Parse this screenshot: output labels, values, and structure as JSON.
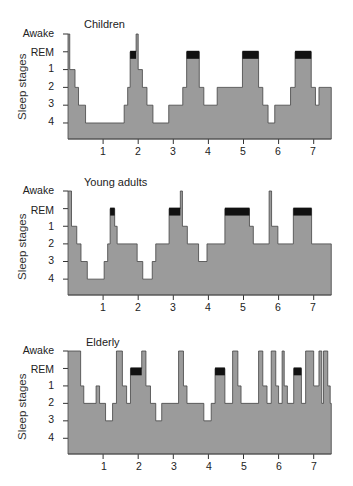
{
  "chart_data": [
    {
      "type": "area",
      "title": "Children",
      "xlabel": "",
      "ylabel": "Sleep stages",
      "x_ticks": [
        "1",
        "2",
        "3",
        "4",
        "5",
        "6",
        "7"
      ],
      "xlim": [
        0,
        7.5
      ],
      "y_ticks": [
        "Awake",
        "REM",
        "1",
        "2",
        "3",
        "4"
      ],
      "grid": false,
      "legend": "none",
      "fill_color": "#9b9b9b",
      "rem_color": "#111111",
      "series": [
        {
          "name": "hypnogram",
          "steps": [
            [
              0.0,
              "Awake"
            ],
            [
              0.05,
              "1"
            ],
            [
              0.2,
              "2"
            ],
            [
              0.3,
              "3"
            ],
            [
              0.5,
              "4"
            ],
            [
              1.6,
              "3"
            ],
            [
              1.7,
              "2"
            ],
            [
              1.77,
              "REM"
            ],
            [
              1.94,
              "Awake"
            ],
            [
              2.0,
              "1"
            ],
            [
              2.12,
              "2"
            ],
            [
              2.25,
              "3"
            ],
            [
              2.42,
              "4"
            ],
            [
              2.87,
              "3"
            ],
            [
              3.27,
              "2"
            ],
            [
              3.38,
              "REM"
            ],
            [
              3.74,
              "2"
            ],
            [
              3.87,
              "3"
            ],
            [
              4.25,
              "2"
            ],
            [
              4.97,
              "REM"
            ],
            [
              5.43,
              "2"
            ],
            [
              5.55,
              "3"
            ],
            [
              5.7,
              "4"
            ],
            [
              5.89,
              "3"
            ],
            [
              6.34,
              "2"
            ],
            [
              6.47,
              "REM"
            ],
            [
              6.93,
              "2"
            ],
            [
              7.05,
              "3"
            ],
            [
              7.15,
              "2"
            ],
            [
              7.5,
              "end"
            ]
          ]
        }
      ],
      "rem_periods": [
        [
          1.77,
          1.94
        ],
        [
          3.38,
          3.74
        ],
        [
          4.97,
          5.43
        ],
        [
          6.47,
          6.93
        ]
      ]
    },
    {
      "type": "area",
      "title": "Young adults",
      "xlabel": "",
      "ylabel": "Sleep stages",
      "x_ticks": [
        "1",
        "2",
        "3",
        "4",
        "5",
        "6",
        "7"
      ],
      "xlim": [
        0,
        7.5
      ],
      "y_ticks": [
        "Awake",
        "REM",
        "1",
        "2",
        "3",
        "4"
      ],
      "grid": false,
      "legend": "none",
      "fill_color": "#9b9b9b",
      "rem_color": "#111111",
      "series": [
        {
          "name": "hypnogram",
          "steps": [
            [
              0.0,
              "Awake"
            ],
            [
              0.1,
              "1"
            ],
            [
              0.25,
              "2"
            ],
            [
              0.37,
              "3"
            ],
            [
              0.55,
              "4"
            ],
            [
              1.03,
              "3"
            ],
            [
              1.13,
              "2"
            ],
            [
              1.2,
              "REM"
            ],
            [
              1.33,
              "1"
            ],
            [
              1.4,
              "2"
            ],
            [
              1.97,
              "3"
            ],
            [
              2.13,
              "4"
            ],
            [
              2.4,
              "3"
            ],
            [
              2.5,
              "2"
            ],
            [
              2.88,
              "REM"
            ],
            [
              3.2,
              "Awake"
            ],
            [
              3.26,
              "1"
            ],
            [
              3.4,
              "2"
            ],
            [
              3.72,
              "3"
            ],
            [
              3.96,
              "2"
            ],
            [
              4.47,
              "REM"
            ],
            [
              5.17,
              "1"
            ],
            [
              5.28,
              "2"
            ],
            [
              5.73,
              "Awake"
            ],
            [
              5.8,
              "1"
            ],
            [
              5.98,
              "2"
            ],
            [
              6.42,
              "REM"
            ],
            [
              6.94,
              "2"
            ],
            [
              7.5,
              "end"
            ]
          ]
        }
      ],
      "rem_periods": [
        [
          1.2,
          1.33
        ],
        [
          2.88,
          3.2
        ],
        [
          4.47,
          5.17
        ],
        [
          6.42,
          6.94
        ]
      ]
    },
    {
      "type": "area",
      "title": "Elderly",
      "xlabel": "",
      "ylabel": "Sleep stages",
      "x_ticks": [
        "1",
        "2",
        "3",
        "4",
        "5",
        "6",
        "7"
      ],
      "xlim": [
        0,
        7.5
      ],
      "y_ticks": [
        "Awake",
        "REM",
        "1",
        "2",
        "3",
        "4"
      ],
      "grid": false,
      "legend": "none",
      "fill_color": "#9b9b9b",
      "rem_color": "#111111",
      "series": [
        {
          "name": "hypnogram",
          "steps": [
            [
              0.0,
              "Awake"
            ],
            [
              0.36,
              "1"
            ],
            [
              0.45,
              "2"
            ],
            [
              0.8,
              "1"
            ],
            [
              0.9,
              "2"
            ],
            [
              1.07,
              "3"
            ],
            [
              1.27,
              "2"
            ],
            [
              1.38,
              "Awake"
            ],
            [
              1.55,
              "1"
            ],
            [
              1.67,
              "2"
            ],
            [
              1.78,
              "REM"
            ],
            [
              2.1,
              "Awake"
            ],
            [
              2.22,
              "1"
            ],
            [
              2.35,
              "2"
            ],
            [
              2.5,
              "3"
            ],
            [
              2.67,
              "2"
            ],
            [
              3.15,
              "Awake"
            ],
            [
              3.29,
              "1"
            ],
            [
              3.39,
              "2"
            ],
            [
              3.87,
              "3"
            ],
            [
              4.08,
              "2"
            ],
            [
              4.19,
              "REM"
            ],
            [
              4.47,
              "2"
            ],
            [
              4.69,
              "Awake"
            ],
            [
              4.84,
              "1"
            ],
            [
              4.93,
              "2"
            ],
            [
              5.43,
              "Awake"
            ],
            [
              5.55,
              "1"
            ],
            [
              5.67,
              "2"
            ],
            [
              5.79,
              "Awake"
            ],
            [
              5.92,
              "1"
            ],
            [
              6.0,
              "2"
            ],
            [
              6.1,
              "Awake"
            ],
            [
              6.16,
              "1"
            ],
            [
              6.25,
              "2"
            ],
            [
              6.43,
              "REM"
            ],
            [
              6.65,
              "2"
            ],
            [
              6.77,
              "Awake"
            ],
            [
              7.0,
              "1"
            ],
            [
              7.15,
              "Awake"
            ],
            [
              7.23,
              "2"
            ],
            [
              7.28,
              "Awake"
            ],
            [
              7.4,
              "1"
            ],
            [
              7.47,
              "2"
            ],
            [
              7.5,
              "end"
            ]
          ]
        }
      ],
      "rem_periods": [
        [
          1.78,
          2.1
        ],
        [
          4.19,
          4.47
        ],
        [
          6.43,
          6.65
        ]
      ]
    }
  ],
  "panels": [
    {
      "title": "Children",
      "ylabel": "Sleep stages"
    },
    {
      "title": "Young adults",
      "ylabel": "Sleep stages"
    },
    {
      "title": "Elderly",
      "ylabel": "Sleep stages"
    }
  ],
  "stage_labels": [
    "Awake",
    "REM",
    "1",
    "2",
    "3",
    "4"
  ],
  "x_tick_labels": [
    "1",
    "2",
    "3",
    "4",
    "5",
    "6",
    "7"
  ]
}
